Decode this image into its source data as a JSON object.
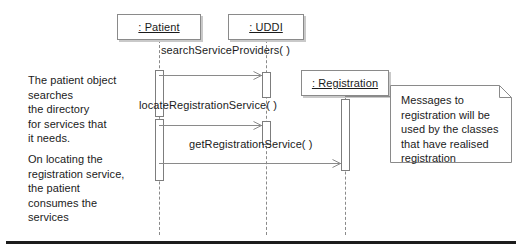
{
  "diagram": {
    "background_color": "#ffffff",
    "line_color": "#8a8a8a",
    "text_color": "#1b1b1b",
    "shadow_color": "#c9c9c9"
  },
  "objects": [
    {
      "id": "patient",
      "label": ": Patient",
      "x": 117,
      "y": 14,
      "w": 84,
      "h": 26,
      "lifeline_x": 159
    },
    {
      "id": "uddi",
      "label": ": UDDI",
      "x": 228,
      "y": 14,
      "w": 76,
      "h": 26,
      "lifeline_x": 266
    },
    {
      "id": "registration",
      "label": ": Registration",
      "x": 301,
      "y": 70,
      "w": 88,
      "h": 26,
      "lifeline_x": 345
    }
  ],
  "messages": [
    {
      "id": "m1",
      "label": "searchServiceProviders( )",
      "from": "patient",
      "to": "uddi",
      "label_x": 161,
      "label_y": 44,
      "y": 75
    },
    {
      "id": "m2",
      "label": "locateRegistrationService( )",
      "from": "patient",
      "to": "uddi",
      "label_x": 139,
      "label_y": 99,
      "y": 125
    },
    {
      "id": "m3",
      "label": "getRegistrationService( )",
      "from": "patient",
      "to": "registration",
      "label_x": 189,
      "label_y": 138,
      "y": 163
    }
  ],
  "annotations": [
    {
      "id": "note-left-top",
      "text": "The patient object\nsearches\nthe directory\nfor services that\nit needs.",
      "x": 28,
      "y": 73
    },
    {
      "id": "note-left-bottom",
      "text": "On locating the\nregistration service,\nthe patient\nconsumes the\nservices",
      "x": 28,
      "y": 152
    }
  ],
  "uml_note": {
    "id": "registration-note",
    "text": "Messages to\nregistration will be\nused by the classes\nthat have realised\nregistration",
    "x": 390,
    "y": 85,
    "w": 122,
    "h": 78,
    "fold": 12
  },
  "icons": {
    "arrowhead": "open-arrowhead-icon",
    "note_fold": "note-fold-corner-icon"
  }
}
